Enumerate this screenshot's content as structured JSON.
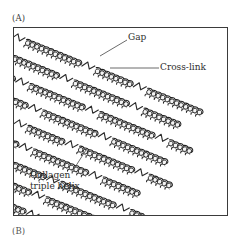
{
  "figure": {
    "panels": [
      {
        "id": "A",
        "label": "(A)"
      },
      {
        "id": "B",
        "label": "(B)"
      }
    ],
    "frame": {
      "border_color": "#3b3b3b",
      "background": "#ffffff"
    },
    "callouts": [
      {
        "name": "gap",
        "text": "Gap"
      },
      {
        "name": "cross-link",
        "text": "Cross-link"
      },
      {
        "name": "collagen-triple-helix",
        "text": "Collagen\ntriple helix"
      }
    ],
    "colors": {
      "ink": "#2e2e2e",
      "helix_outline": "#1f1f1f",
      "helix_fill": "#f2f2f2",
      "helix_shade": "#a8a8a8",
      "leader_line": "#5a5a5a"
    },
    "structure": {
      "row_count": 8,
      "row_angle_deg": 22,
      "molecule_style": "braided triple helix rod",
      "linker_style": "zigzag cross-link",
      "notes": "staggered rows of rod-shaped molecules separated by gaps and joined end-to-end by cross-links"
    }
  }
}
